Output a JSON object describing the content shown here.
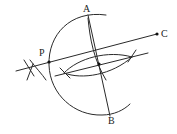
{
  "figure": {
    "type": "geometric-construction",
    "labels": {
      "A": "A",
      "B": "B",
      "C": "C",
      "P": "P"
    },
    "points": {
      "A": [
        88,
        15
      ],
      "B": [
        109,
        114
      ],
      "C": [
        157,
        34
      ],
      "P": [
        49,
        62
      ],
      "M": [
        99,
        64
      ]
    },
    "segments": [
      {
        "name": "line-AB",
        "from": [
          88,
          15
        ],
        "to": [
          110,
          116
        ]
      },
      {
        "name": "line-through-P-to-C",
        "from": [
          16,
          71
        ],
        "to": [
          157,
          34
        ]
      },
      {
        "name": "parallel-line",
        "from": [
          55,
          76
        ],
        "to": [
          148,
          53
        ]
      }
    ],
    "colors": {
      "stroke": "#2a2a2a",
      "background": "#ffffff"
    }
  }
}
